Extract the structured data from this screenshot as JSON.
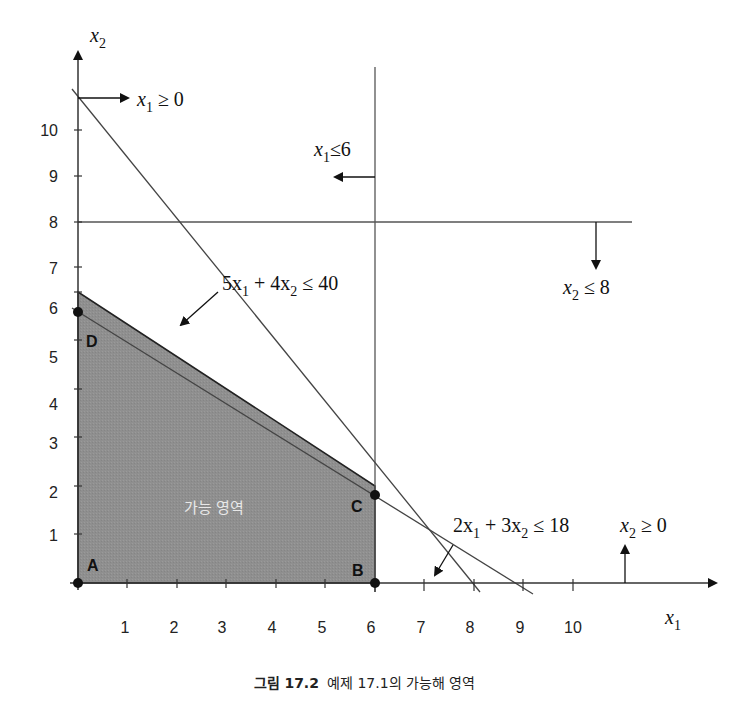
{
  "diagram": {
    "axes": {
      "x_label": "x",
      "x_label_sub": "1",
      "y_label": "x",
      "y_label_sub": "2",
      "x_ticks": [
        "1",
        "2",
        "3",
        "4",
        "5",
        "6",
        "7",
        "8",
        "9",
        "10"
      ],
      "y_ticks": [
        "1",
        "2",
        "3",
        "4",
        "5",
        "6",
        "7",
        "8",
        "9",
        "10"
      ]
    },
    "constraints": [
      {
        "id": "x1_nonneg",
        "label_parts": [
          "x",
          "1",
          " ≥ 0"
        ]
      },
      {
        "id": "x1_le_6",
        "label_parts": [
          "x",
          "1",
          "≤6"
        ]
      },
      {
        "id": "x2_le_8",
        "label_parts": [
          "x",
          "2",
          " ≤ 8"
        ]
      },
      {
        "id": "c1",
        "label_parts": [
          "5x",
          "1",
          " + 4x",
          "2",
          " ≤ 40"
        ]
      },
      {
        "id": "c2",
        "label_parts": [
          "2x",
          "1",
          " + 3x",
          "2",
          " ≤ 18"
        ]
      },
      {
        "id": "x2_nonneg",
        "label_parts": [
          "x",
          "2",
          " ≥ 0"
        ]
      }
    ],
    "vertices": [
      {
        "label": "A",
        "x": 0,
        "y": 0
      },
      {
        "label": "B",
        "x": 6,
        "y": 0
      },
      {
        "label": "C",
        "x": 6,
        "y": 2
      },
      {
        "label": "D",
        "x": 0,
        "y": 6
      }
    ],
    "region_label": "가능 영역",
    "colors": {
      "region_fill": "#8f8f8f",
      "line": "#555555",
      "axis": "#333333"
    }
  },
  "caption": {
    "figure_number": "그림 17.2",
    "text": "예제 17.1의 가능해 영역"
  }
}
